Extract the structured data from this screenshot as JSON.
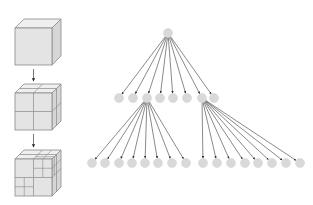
{
  "figure": {
    "colors": {
      "background": "#ffffff",
      "cube_face": "#e4e4e4",
      "cube_top": "#efefef",
      "cube_side": "#d6d6d6",
      "cube_edge": "#8a8a8a",
      "node_fill": "#d9d9d9",
      "edge_line": "#3a3a3a"
    }
  },
  "cubes": [
    {
      "level": 0,
      "label": "undivided-cube",
      "subdivision": "none"
    },
    {
      "level": 1,
      "label": "cube-split-8",
      "subdivision": "2x2x2"
    },
    {
      "level": 2,
      "label": "cube-split-recursive",
      "subdivision": "2x2x2 with further subdivided octants"
    }
  ],
  "tree": {
    "root": {
      "x": 168,
      "y": 33
    },
    "level1": {
      "y": 98,
      "x": [
        119,
        133,
        147,
        160,
        173,
        187,
        202,
        214
      ]
    },
    "level2_left": {
      "parent_index": 2,
      "y": 163,
      "x": [
        92,
        105,
        119,
        132,
        145,
        158,
        172,
        186
      ]
    },
    "level2_right": {
      "parent_index": 6,
      "y": 163,
      "x": [
        203,
        217,
        231,
        245,
        258,
        272,
        286,
        300
      ]
    },
    "node_radius": 4.5
  }
}
